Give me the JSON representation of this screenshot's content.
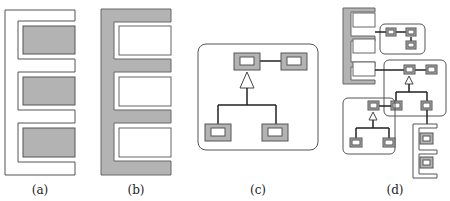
{
  "colors": {
    "fill_gray": "#b3b3b3",
    "stroke": "#555555",
    "line": "#222222",
    "bg": "#ffffff"
  },
  "panels": [
    {
      "id": "a",
      "label": "(a)",
      "description": "E-shaped white frame with three gray filled slots"
    },
    {
      "id": "b",
      "label": "(b)",
      "description": "E-shaped gray frame with three white slots"
    },
    {
      "id": "c",
      "label": "(c)",
      "description": "Rounded container with class-like boxes: top pair connected, inheritance triangle to two child boxes"
    },
    {
      "id": "d",
      "label": "(d)",
      "description": "Composite: gray E-frame slots linked to nested rounded containers of boxes with inheritance and a white E-frame with gray slots"
    }
  ]
}
